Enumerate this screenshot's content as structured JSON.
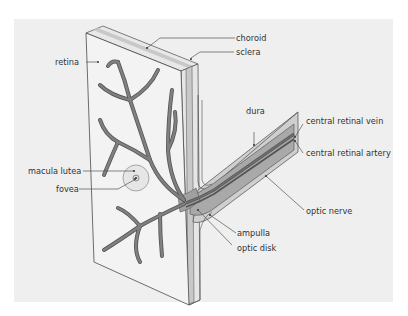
{
  "diagram": {
    "colors": {
      "background_panel": "#efefef",
      "retina_face": "#f3f3f3",
      "vessel_fill": "#808080",
      "vessel_stroke": "#555555",
      "nerve_fill": "#a9a9a9",
      "layer_choroid": "#c8c8c8",
      "layer_sclera": "#e6e6e6",
      "outline": "#4a4a4a",
      "label_text": "#333333"
    },
    "labels": {
      "retina": "retina",
      "choroid": "choroid",
      "sclera": "sclera",
      "dura": "dura",
      "central_retinal_vein": "central retinal vein",
      "central_retinal_artery": "central retinal artery",
      "macula_lutea": "macula lutea",
      "fovea": "fovea",
      "optic_nerve": "optic nerve",
      "ampulla": "ampulla",
      "optic_disk": "optic disk"
    }
  }
}
